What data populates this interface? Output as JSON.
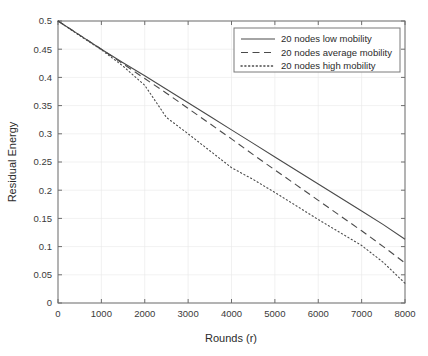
{
  "chart_data": {
    "type": "line",
    "title": "",
    "xlabel": "Rounds (r)",
    "ylabel": "Residual Energy",
    "xlim": [
      0,
      8000
    ],
    "ylim": [
      0,
      0.5
    ],
    "grid": true,
    "legend_position": "top-right",
    "xticks": [
      0,
      1000,
      2000,
      3000,
      4000,
      5000,
      6000,
      7000,
      8000
    ],
    "xtick_labels": [
      "0",
      "1000",
      "2000",
      "3000",
      "4000",
      "5000",
      "6000",
      "7000",
      "8000"
    ],
    "yticks": [
      0,
      0.05,
      0.1,
      0.15,
      0.2,
      0.25,
      0.3,
      0.35,
      0.4,
      0.45,
      0.5
    ],
    "ytick_labels": [
      "0",
      "0.05",
      "0.1",
      "0.15",
      "0.2",
      "0.25",
      "0.3",
      "0.35",
      "0.4",
      "0.45",
      "0.5"
    ],
    "x": [
      0,
      500,
      1000,
      1500,
      2000,
      2500,
      3000,
      3500,
      4000,
      4500,
      5000,
      5500,
      6000,
      6500,
      7000,
      7500,
      8000
    ],
    "series": [
      {
        "name": "20 nodes low mobility",
        "style": "solid",
        "color": "#4a4a4a",
        "values": [
          0.5,
          0.475,
          0.45,
          0.426,
          0.403,
          0.379,
          0.355,
          0.331,
          0.307,
          0.283,
          0.259,
          0.235,
          0.211,
          0.187,
          0.163,
          0.139,
          0.113
        ]
      },
      {
        "name": "20 nodes average mobility",
        "style": "dashed",
        "color": "#4a4a4a",
        "values": [
          0.5,
          0.475,
          0.45,
          0.424,
          0.398,
          0.372,
          0.345,
          0.318,
          0.291,
          0.263,
          0.236,
          0.209,
          0.182,
          0.155,
          0.128,
          0.1,
          0.071
        ]
      },
      {
        "name": "20 nodes high mobility",
        "style": "dotted",
        "color": "#4a4a4a",
        "values": [
          0.5,
          0.474,
          0.449,
          0.42,
          0.386,
          0.329,
          0.3,
          0.27,
          0.24,
          0.219,
          0.196,
          0.172,
          0.148,
          0.125,
          0.102,
          0.072,
          0.035
        ]
      }
    ],
    "legend_entries": [
      "20 nodes low mobility",
      "20 nodes average mobility",
      "20 nodes high mobility"
    ]
  }
}
